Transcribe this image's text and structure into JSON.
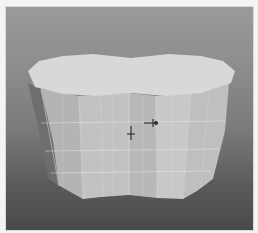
{
  "viewport": {
    "label": "3D viewport - perspective",
    "background_top": "#9a9a9a",
    "background_bottom": "#4a4a4a"
  },
  "mesh": {
    "name": "extruded peanut-shaped prism",
    "top_face_color": "#d6d6d6",
    "front_face_color": "#bcbcbc",
    "side_light_color": "#c6c6c6",
    "side_dark_color": "#6e6e6e",
    "edge_color": "#e8e8e8"
  },
  "gizmo": {
    "type": "move-transform-gizmo",
    "color": "#333333"
  }
}
